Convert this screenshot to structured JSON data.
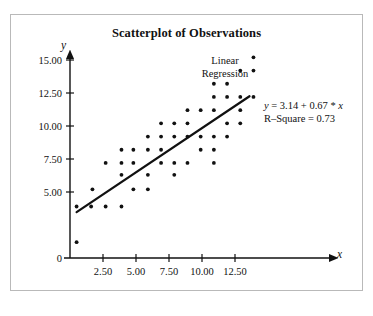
{
  "chart_data": {
    "type": "scatter",
    "title": "Scatterplot of Observations",
    "xlabel": "x",
    "ylabel": "y",
    "xlim": [
      0,
      15
    ],
    "ylim": [
      0,
      16.2
    ],
    "grid": false,
    "legend_position": "none",
    "x_ticks": [
      2.5,
      5.0,
      7.5,
      10.0,
      12.5
    ],
    "x_tick_labels": [
      "2.50",
      "5.00",
      "7.50",
      "10.00",
      "12.50"
    ],
    "y_ticks": [
      0,
      5.0,
      7.5,
      10.0,
      12.5,
      15.0
    ],
    "y_tick_labels": [
      "0",
      "5.00",
      "7.50",
      "10.00",
      "12.50",
      "15.00"
    ],
    "point_color": "#111111",
    "line_color": "#111111",
    "points": [
      [
        0.5,
        1.2
      ],
      [
        0.5,
        3.9
      ],
      [
        1.6,
        3.9
      ],
      [
        1.7,
        5.2
      ],
      [
        2.7,
        3.9
      ],
      [
        2.7,
        7.2
      ],
      [
        3.9,
        3.9
      ],
      [
        3.9,
        6.3
      ],
      [
        3.9,
        7.2
      ],
      [
        3.9,
        8.2
      ],
      [
        4.8,
        5.2
      ],
      [
        4.8,
        7.2
      ],
      [
        4.8,
        8.2
      ],
      [
        5.9,
        5.2
      ],
      [
        5.9,
        6.3
      ],
      [
        5.9,
        8.2
      ],
      [
        5.9,
        9.2
      ],
      [
        6.9,
        7.2
      ],
      [
        6.9,
        8.2
      ],
      [
        6.9,
        9.2
      ],
      [
        6.9,
        10.2
      ],
      [
        7.9,
        6.3
      ],
      [
        7.9,
        7.2
      ],
      [
        7.9,
        9.2
      ],
      [
        7.9,
        10.2
      ],
      [
        8.9,
        7.2
      ],
      [
        8.9,
        9.2
      ],
      [
        8.9,
        10.2
      ],
      [
        8.9,
        11.2
      ],
      [
        9.9,
        8.2
      ],
      [
        9.9,
        9.2
      ],
      [
        9.9,
        11.2
      ],
      [
        10.9,
        7.2
      ],
      [
        10.9,
        8.2
      ],
      [
        10.9,
        9.2
      ],
      [
        10.9,
        11.2
      ],
      [
        10.9,
        12.2
      ],
      [
        10.9,
        13.2
      ],
      [
        11.9,
        9.2
      ],
      [
        11.9,
        10.2
      ],
      [
        11.9,
        12.2
      ],
      [
        11.9,
        13.2
      ],
      [
        12.9,
        10.2
      ],
      [
        12.9,
        11.2
      ],
      [
        12.9,
        12.2
      ],
      [
        12.9,
        14.2
      ],
      [
        13.9,
        12.2
      ],
      [
        13.9,
        14.2
      ],
      [
        13.9,
        15.2
      ]
    ],
    "regression": {
      "label_line_1": "Linear",
      "label_line_2": "Regression",
      "equation": "y = 3.14 + 0.67 * x",
      "equation_prefix_italic": "y",
      "equation_body": " = 3.14 + 0.67 * ",
      "equation_suffix_italic": "x",
      "r_square_text": "R–Square = 0.73",
      "intercept": 3.14,
      "slope": 0.67,
      "r_square": 0.73,
      "x_start": 0.5,
      "x_end": 13.6
    }
  }
}
